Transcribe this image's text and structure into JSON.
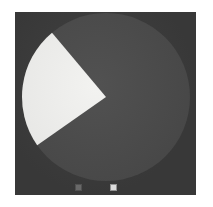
{
  "figure": {
    "background_color": "#ffffff",
    "panel_color": "#3b3b3b",
    "panel_label": "pie-chart-panel"
  },
  "chart_data": {
    "type": "pie",
    "title": "",
    "subtitle": "",
    "xlabel": "",
    "ylabel": "",
    "grid": false,
    "legend_position": "none",
    "center": {
      "x": 91,
      "y": 85
    },
    "radius": 84,
    "start_angle_deg": 130,
    "direction": "counterclockwise",
    "categories": [
      "Slice A",
      "Slice B"
    ],
    "values": [
      24,
      76
    ],
    "percentages": [
      "24%",
      "76%"
    ],
    "colors": [
      "#f2f2f0",
      "#4b4b4b"
    ],
    "slices": [
      {
        "label": "Slice A",
        "value": 24,
        "percent": "24%",
        "color": "#f2f2f0",
        "start_angle_deg": 130,
        "end_angle_deg": 215,
        "sweep_deg": 85,
        "exploded": false
      },
      {
        "label": "Slice B",
        "value": 76,
        "percent": "76%",
        "color": "#4b4b4b",
        "start_angle_deg": 215,
        "end_angle_deg": 490,
        "sweep_deg": 275,
        "exploded": false
      }
    ],
    "annotations": []
  },
  "axis_markers": [
    {
      "name": "marker-left",
      "color": "#6e6e6e",
      "x": 60,
      "y": 172
    },
    {
      "name": "marker-right",
      "color": "#e8e8e8",
      "x": 95,
      "y": 172
    }
  ]
}
